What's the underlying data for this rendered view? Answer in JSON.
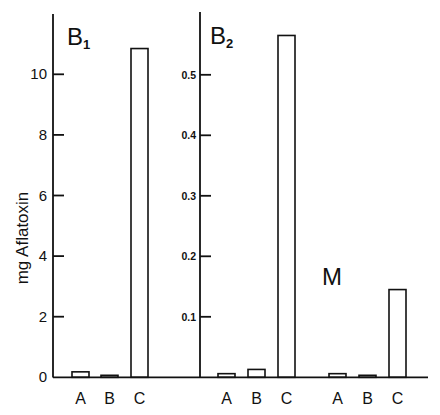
{
  "chart_data": {
    "type": "bar",
    "title": "",
    "ylabel": "mg Aflatoxin",
    "xlabel": "",
    "grid": false,
    "legend": null,
    "panels": [
      {
        "title": "B",
        "subscript": "1",
        "categories": [
          "A",
          "B",
          "C"
        ],
        "values": [
          0.18,
          0.05,
          10.85
        ],
        "ylim": [
          0,
          12
        ],
        "yticks": [
          0,
          2,
          4,
          6,
          8,
          10
        ],
        "ytick_labels": [
          "0",
          "2",
          "4",
          "6",
          "8",
          "10"
        ]
      },
      {
        "title": "B",
        "subscript": "2",
        "categories": [
          "A",
          "B",
          "C"
        ],
        "values": [
          0.006,
          0.013,
          0.565
        ],
        "ylim": [
          0,
          0.6
        ],
        "yticks": [
          0.1,
          0.2,
          0.3,
          0.4,
          0.5
        ],
        "ytick_labels": [
          "0.1",
          "0.2",
          "0.3",
          "0.4",
          "0.5"
        ]
      },
      {
        "title": "M",
        "subscript": "",
        "categories": [
          "A",
          "B",
          "C"
        ],
        "values": [
          0.006,
          0.003,
          0.145
        ],
        "ylim": [
          0,
          0.6
        ],
        "shared_axis_with": "B2"
      }
    ]
  },
  "labels": {
    "ylabel": "mg Aflatoxin",
    "panel1_title": "B",
    "panel1_sub": "1",
    "panel2_title": "B",
    "panel2_sub": "2",
    "panel3_title": "M",
    "cats": [
      "A",
      "B",
      "C"
    ],
    "p1_ticks": [
      "0",
      "2",
      "4",
      "6",
      "8",
      "10"
    ],
    "p2_ticks": [
      "0.1",
      "0.2",
      "0.3",
      "0.4",
      "0.5"
    ]
  }
}
